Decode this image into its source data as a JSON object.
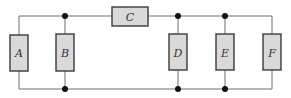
{
  "diagram": {
    "type": "resistor-circuit",
    "colors": {
      "wire": "#6f6f6f",
      "resistor_fill": "#d9d9d9",
      "resistor_stroke": "#3a3a3a",
      "node": "#111111"
    },
    "resistors": [
      {
        "id": "A",
        "label": "A",
        "orientation": "vertical"
      },
      {
        "id": "B",
        "label": "B",
        "orientation": "vertical"
      },
      {
        "id": "C",
        "label": "C",
        "orientation": "horizontal"
      },
      {
        "id": "D",
        "label": "D",
        "orientation": "vertical"
      },
      {
        "id": "E",
        "label": "E",
        "orientation": "vertical"
      },
      {
        "id": "F",
        "label": "F",
        "orientation": "vertical"
      }
    ],
    "nodes": [
      {
        "id": "top-B"
      },
      {
        "id": "bottom-B"
      },
      {
        "id": "top-D"
      },
      {
        "id": "bottom-D"
      },
      {
        "id": "top-E"
      },
      {
        "id": "bottom-E"
      }
    ]
  }
}
